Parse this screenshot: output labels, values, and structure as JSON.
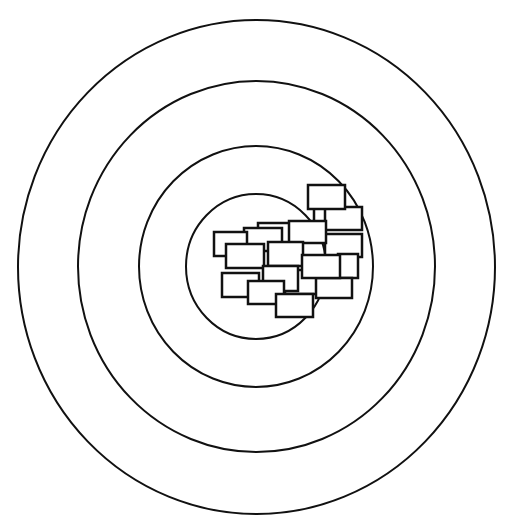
{
  "canvas": {
    "width": 508,
    "height": 524,
    "background": "#ffffff",
    "stroke": "#111111"
  },
  "rings": [
    {
      "name": "outer-ring",
      "cx": 256.5,
      "cy": 267,
      "rx": 238.5,
      "ry": 247,
      "stroke_width": 2
    },
    {
      "name": "ring-2",
      "cx": 256.5,
      "cy": 266.5,
      "rx": 178.5,
      "ry": 185.5,
      "stroke_width": 2
    },
    {
      "name": "ring-3",
      "cx": 256,
      "cy": 266.5,
      "rx": 117,
      "ry": 120.5,
      "stroke_width": 2
    },
    {
      "name": "inner-ring",
      "cx": 256,
      "cy": 266.5,
      "rx": 70,
      "ry": 72.5,
      "stroke_width": 2
    }
  ],
  "boxes": [
    {
      "x": 258,
      "y": 223,
      "w": 36,
      "h": 22
    },
    {
      "x": 244,
      "y": 228,
      "w": 38,
      "h": 23
    },
    {
      "x": 214,
      "y": 232,
      "w": 33,
      "h": 24
    },
    {
      "x": 226,
      "y": 244,
      "w": 38,
      "h": 24
    },
    {
      "x": 325,
      "y": 234,
      "w": 37,
      "h": 23
    },
    {
      "x": 338,
      "y": 254,
      "w": 20,
      "h": 24
    },
    {
      "x": 314,
      "y": 206,
      "w": 18,
      "h": 20
    },
    {
      "x": 325,
      "y": 207,
      "w": 37,
      "h": 23
    },
    {
      "x": 308,
      "y": 185,
      "w": 37,
      "h": 24
    },
    {
      "x": 289,
      "y": 221,
      "w": 37,
      "h": 22
    },
    {
      "x": 268,
      "y": 242,
      "w": 35,
      "h": 24
    },
    {
      "x": 285,
      "y": 270,
      "w": 34,
      "h": 24
    },
    {
      "x": 316,
      "y": 278,
      "w": 36,
      "h": 20
    },
    {
      "x": 302,
      "y": 255,
      "w": 38,
      "h": 23
    },
    {
      "x": 263,
      "y": 266,
      "w": 35,
      "h": 25
    },
    {
      "x": 222,
      "y": 273,
      "w": 37,
      "h": 24
    },
    {
      "x": 248,
      "y": 281,
      "w": 36,
      "h": 23
    },
    {
      "x": 276,
      "y": 294,
      "w": 37,
      "h": 23
    }
  ]
}
